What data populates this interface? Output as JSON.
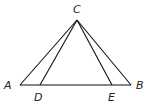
{
  "diagram": {
    "type": "geometry-figure",
    "points": {
      "A": {
        "label": "A"
      },
      "B": {
        "label": "B"
      },
      "C": {
        "label": "C"
      },
      "D": {
        "label": "D"
      },
      "E": {
        "label": "E"
      }
    },
    "segments": [
      {
        "name": "segment-ab",
        "from": "A",
        "to": "B"
      },
      {
        "name": "segment-ca",
        "from": "C",
        "to": "A"
      },
      {
        "name": "segment-cb",
        "from": "C",
        "to": "B"
      },
      {
        "name": "segment-cd",
        "from": "C",
        "to": "D"
      },
      {
        "name": "segment-ce",
        "from": "C",
        "to": "E"
      }
    ],
    "colors": {
      "line": "#111111",
      "label": "#222222",
      "background": "#ffffff"
    }
  }
}
